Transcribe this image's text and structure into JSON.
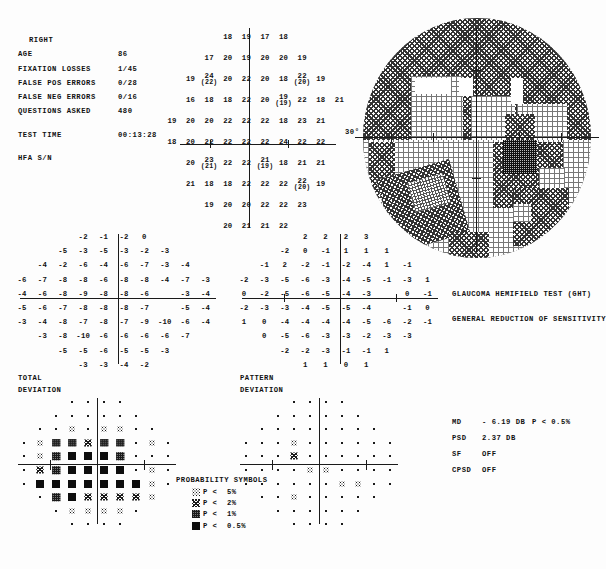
{
  "header": {
    "eye": "RIGHT",
    "rows": [
      {
        "label": "AGE",
        "value": "86"
      },
      {
        "label": "FIXATION LOSSES",
        "value": "1/45"
      },
      {
        "label": "FALSE POS ERRORS",
        "value": "0/28"
      },
      {
        "label": "FALSE NEG ERRORS",
        "value": "0/16"
      },
      {
        "label": "QUESTIONS ASKED",
        "value": "480"
      }
    ],
    "test_time_label": "TEST TIME",
    "test_time_value": "00:13:28",
    "serial_label": "HFA S/N",
    "serial_value": ""
  },
  "grayscale": {
    "axis_label": "30°"
  },
  "ght": {
    "title": "GLAUCOMA HEMIFIELD TEST (GHT)",
    "result": "GENERAL REDUCTION OF SENSITIVITY"
  },
  "indices": [
    {
      "key": "MD",
      "value": "- 6.19 DB",
      "p": "P < 0.5%"
    },
    {
      "key": "PSD",
      "value": "2.37 DB",
      "p": ""
    },
    {
      "key": "SF",
      "value": "OFF",
      "p": ""
    },
    {
      "key": "CPSD",
      "value": "OFF",
      "p": ""
    }
  ],
  "labels": {
    "total_deviation_1": "TOTAL",
    "total_deviation_2": "DEVIATION",
    "pattern_deviation_1": "PATTERN",
    "pattern_deviation_2": "DEVIATION"
  },
  "legend": {
    "title": "PROBABILITY SYMBOLS",
    "items": [
      {
        "sym": "p5",
        "p": "P <",
        "value": "5%"
      },
      {
        "sym": "p2",
        "p": "P <",
        "value": "2%"
      },
      {
        "sym": "p1",
        "p": "P <",
        "value": "1%"
      },
      {
        "sym": "p05",
        "p": "P <",
        "value": "0.5%"
      }
    ]
  },
  "caption": "",
  "chart_data": [
    {
      "type": "heatmap",
      "name": "raw-threshold-values",
      "title": "Numeric threshold sensitivity values (dB), right eye, 30-2",
      "units": "dB",
      "xlabel": "",
      "ylabel": "",
      "rows": [
        [
          null,
          null,
          null,
          "18",
          "19",
          "17",
          "18",
          null,
          null,
          null
        ],
        [
          null,
          null,
          "17",
          "20",
          "19",
          "20",
          "20",
          "19",
          null,
          null
        ],
        [
          null,
          "19",
          "24(22)",
          "20",
          "22",
          "20",
          "18",
          "22(20)",
          "19",
          null
        ],
        [
          null,
          "16",
          "18",
          "18",
          "22",
          "20",
          "19(19)",
          "22",
          "18",
          "21"
        ],
        [
          "19",
          "20",
          "20",
          "22",
          "22",
          "22",
          "18",
          "23",
          "21",
          null
        ],
        [
          "18",
          "20",
          "22",
          "22",
          "22",
          "22",
          "24",
          "22",
          "22",
          null
        ],
        [
          null,
          "20",
          "23(21)",
          "22",
          "22",
          "21(19)",
          "18",
          "21",
          "21",
          null
        ],
        [
          null,
          "21",
          "18",
          "18",
          "22",
          "22",
          "22",
          "22(20)",
          "19",
          null
        ],
        [
          null,
          null,
          "19",
          "20",
          "20",
          "22",
          "22",
          "23",
          null,
          null
        ],
        [
          null,
          null,
          null,
          "20",
          "21",
          "21",
          "22",
          null,
          null,
          null
        ]
      ]
    },
    {
      "type": "heatmap",
      "name": "total-deviation-values",
      "title": "TOTAL DEVIATION",
      "units": "dB",
      "rows": [
        [
          null,
          null,
          null,
          "-2",
          "-1",
          "-2",
          "0",
          null,
          null,
          null
        ],
        [
          null,
          null,
          "-5",
          "-3",
          "-5",
          "-3",
          "-2",
          "-3",
          null,
          null
        ],
        [
          null,
          "-4",
          "-2",
          "-6",
          "-4",
          "-6",
          "-7",
          "-3",
          "-4",
          null
        ],
        [
          "-6",
          "-7",
          "-8",
          "-8",
          "-6",
          "-8",
          "-8",
          "-4",
          "-7",
          "-3"
        ],
        [
          "-4",
          "-6",
          "-8",
          "-9",
          "-8",
          "-8",
          "-6",
          "",
          "-3",
          "-4"
        ],
        [
          "-5",
          "-6",
          "-7",
          "-8",
          "-8",
          "-8",
          "-7",
          "",
          "-5",
          "-4"
        ],
        [
          "-3",
          "-4",
          "-8",
          "-7",
          "-8",
          "-7",
          "-9",
          "-10",
          "-6",
          "-4"
        ],
        [
          null,
          "-3",
          "-8",
          "-10",
          "-6",
          "-6",
          "-6",
          "-6",
          "-7",
          null
        ],
        [
          null,
          null,
          "-5",
          "-5",
          "-6",
          "-5",
          "-5",
          "-3",
          null,
          null
        ],
        [
          null,
          null,
          null,
          "-3",
          "-3",
          "-4",
          "-2",
          null,
          null,
          null
        ]
      ]
    },
    {
      "type": "heatmap",
      "name": "pattern-deviation-values",
      "title": "PATTERN DEVIATION",
      "units": "dB",
      "rows": [
        [
          null,
          null,
          null,
          "2",
          "2",
          "2",
          "3",
          null,
          null,
          null
        ],
        [
          null,
          null,
          "-2",
          "0",
          "-1",
          "1",
          "1",
          "1",
          null,
          null
        ],
        [
          null,
          "-1",
          "2",
          "-2",
          "-1",
          "-2",
          "-4",
          "1",
          "-1",
          null
        ],
        [
          "-2",
          "-3",
          "-5",
          "-6",
          "-3",
          "-4",
          "-5",
          "-1",
          "-3",
          "1"
        ],
        [
          "0",
          "-2",
          "-5",
          "-6",
          "-5",
          "-4",
          "-3",
          "",
          "0",
          "-1"
        ],
        [
          "-2",
          "-3",
          "-3",
          "-4",
          "-5",
          "-5",
          "-4",
          "",
          "-1",
          "0"
        ],
        [
          "1",
          "0",
          "-4",
          "-4",
          "-4",
          "-4",
          "-5",
          "-6",
          "-2",
          "-1"
        ],
        [
          null,
          "0",
          "-5",
          "-6",
          "-3",
          "-3",
          "-2",
          "-3",
          "-3",
          null
        ],
        [
          null,
          null,
          "-2",
          "-2",
          "-3",
          "-1",
          "-1",
          "1",
          null,
          null
        ],
        [
          null,
          null,
          null,
          "1",
          "1",
          "0",
          "1",
          null,
          null,
          null
        ]
      ]
    },
    {
      "type": "heatmap",
      "name": "total-deviation-probability",
      "title": "TOTAL DEVIATION probability plot",
      "legend": [
        "dot",
        "p5",
        "p2",
        "p1",
        "p05"
      ],
      "rows": [
        [
          null,
          null,
          null,
          "dot",
          "dot",
          "dot",
          "dot",
          null,
          null,
          null
        ],
        [
          null,
          null,
          "dot",
          "dot",
          "dot",
          "dot",
          "dot",
          "dot",
          null,
          null
        ],
        [
          null,
          "dot",
          "dot",
          "p5",
          "dot",
          "p5",
          "p5",
          "dot",
          "dot",
          null
        ],
        [
          "dot",
          "p5",
          "p1",
          "p1",
          "p2",
          "p1",
          "p1",
          "dot",
          "p5",
          "dot"
        ],
        [
          "dot",
          "p5",
          "p1",
          "p05",
          "p05",
          "p05",
          "p1",
          "dot",
          "dot",
          "dot"
        ],
        [
          "dot",
          "p2",
          "p1",
          "p05",
          "p05",
          "p05",
          "p05",
          "dot",
          "p5",
          "dot"
        ],
        [
          "dot",
          "p05",
          "p05",
          "p05",
          "p05",
          "p05",
          "p05",
          "p05",
          "p5",
          "dot"
        ],
        [
          null,
          "dot",
          "p1",
          "p05",
          "p2",
          "p2",
          "p2",
          "p2",
          "p5",
          null
        ],
        [
          null,
          null,
          "dot",
          "p5",
          "p5",
          "p5",
          "p5",
          "dot",
          null,
          null
        ],
        [
          null,
          null,
          null,
          "dot",
          "dot",
          "dot",
          "dot",
          null,
          null,
          null
        ]
      ]
    },
    {
      "type": "heatmap",
      "name": "pattern-deviation-probability",
      "title": "PATTERN DEVIATION probability plot",
      "legend": [
        "dot",
        "p5",
        "p2",
        "p1",
        "p05"
      ],
      "rows": [
        [
          null,
          null,
          null,
          "dot",
          "dot",
          "dot",
          "dot",
          null,
          null,
          null
        ],
        [
          null,
          null,
          "dot",
          "dot",
          "dot",
          "dot",
          "dot",
          "dot",
          null,
          null
        ],
        [
          null,
          "dot",
          "dot",
          "dot",
          "dot",
          "dot",
          "dot",
          "dot",
          "dot",
          null
        ],
        [
          "dot",
          "dot",
          "dot",
          "p5",
          "dot",
          "dot",
          "dot",
          "dot",
          "dot",
          "dot"
        ],
        [
          "dot",
          "dot",
          "dot",
          "p2",
          "dot",
          "dot",
          "dot",
          "dot",
          "dot",
          "dot"
        ],
        [
          "dot",
          "dot",
          "dot",
          "dot",
          "p5",
          "p5",
          "dot",
          "dot",
          "dot",
          "dot"
        ],
        [
          "dot",
          "dot",
          "dot",
          "dot",
          "dot",
          "dot",
          "p5",
          "p5",
          "dot",
          "dot"
        ],
        [
          null,
          "dot",
          "dot",
          "p5",
          "dot",
          "dot",
          "dot",
          "dot",
          "dot",
          null
        ],
        [
          null,
          null,
          "dot",
          "dot",
          "dot",
          "dot",
          "dot",
          "dot",
          null,
          null
        ],
        [
          null,
          null,
          null,
          "dot",
          "dot",
          "dot",
          "dot",
          null,
          null,
          null
        ]
      ]
    }
  ]
}
